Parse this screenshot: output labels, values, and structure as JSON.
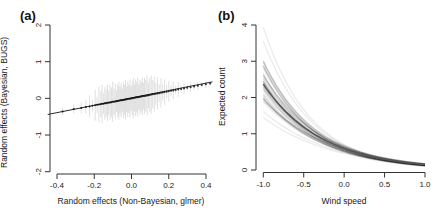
{
  "figure": {
    "background": "#ffffff",
    "text_color": "#1a1a1a",
    "axis_color": "#333333"
  },
  "chart_data": [
    {
      "id": "a",
      "panel_label": "(a)",
      "type": "scatter",
      "xlabel": "Random effects (Non-Bayesian, glmer)",
      "ylabel": "Random effects (Bayesian, BUGS)",
      "xlim": [
        -0.45,
        0.49
      ],
      "ylim": [
        -2,
        2
      ],
      "xticks": {
        "values": [
          -0.4,
          -0.2,
          0,
          0.2,
          0.4
        ],
        "labels": [
          "-0.4",
          "-0.2",
          "0.0",
          "0.2",
          "0.4"
        ]
      },
      "yticks": {
        "values": [
          -2,
          -1,
          0,
          1,
          2
        ],
        "labels": [
          "-2",
          "-1",
          "0",
          "1",
          "2"
        ]
      },
      "grid": false,
      "identity_line": {
        "x1": -0.45,
        "y1": -0.44,
        "x2": 0.435,
        "y2": 0.45
      },
      "colors": {
        "points": "rgba(15,15,15,0.85)",
        "ci": "rgba(0,0,0,0.13)",
        "line": "#2b2b2b",
        "axis": "#333333"
      },
      "point_format": [
        "x",
        "y",
        "ci_half_width"
      ],
      "points": [
        [
          -0.37,
          -0.36,
          0.1
        ],
        [
          -0.31,
          -0.29,
          0.12
        ],
        [
          -0.27,
          -0.26,
          0.15
        ],
        [
          -0.245,
          -0.235,
          0.18
        ],
        [
          -0.225,
          -0.22,
          0.3
        ],
        [
          -0.21,
          -0.2,
          0.16
        ],
        [
          -0.195,
          -0.19,
          0.42
        ],
        [
          -0.185,
          -0.175,
          0.22
        ],
        [
          -0.175,
          -0.165,
          0.48
        ],
        [
          -0.165,
          -0.16,
          0.35
        ],
        [
          -0.158,
          -0.15,
          0.52
        ],
        [
          -0.15,
          -0.145,
          0.28
        ],
        [
          -0.143,
          -0.135,
          0.45
        ],
        [
          -0.136,
          -0.132,
          0.38
        ],
        [
          -0.129,
          -0.122,
          0.5
        ],
        [
          -0.122,
          -0.118,
          0.33
        ],
        [
          -0.115,
          -0.11,
          0.47
        ],
        [
          -0.108,
          -0.105,
          0.4
        ],
        [
          -0.101,
          -0.096,
          0.55
        ],
        [
          -0.094,
          -0.091,
          0.36
        ],
        [
          -0.087,
          -0.083,
          0.49
        ],
        [
          -0.08,
          -0.078,
          0.3
        ],
        [
          -0.074,
          -0.07,
          0.44
        ],
        [
          -0.068,
          -0.066,
          0.52
        ],
        [
          -0.062,
          -0.059,
          0.37
        ],
        [
          -0.056,
          -0.054,
          0.46
        ],
        [
          -0.05,
          -0.049,
          0.31
        ],
        [
          -0.044,
          -0.042,
          0.5
        ],
        [
          -0.038,
          -0.037,
          0.41
        ],
        [
          -0.032,
          -0.03,
          0.54
        ],
        [
          -0.026,
          -0.026,
          0.35
        ],
        [
          -0.02,
          -0.019,
          0.48
        ],
        [
          -0.014,
          -0.013,
          0.39
        ],
        [
          -0.008,
          -0.008,
          0.52
        ],
        [
          -0.002,
          -0.002,
          0.33
        ],
        [
          0.004,
          0.004,
          0.46
        ],
        [
          0.01,
          0.01,
          0.55
        ],
        [
          0.016,
          0.015,
          0.37
        ],
        [
          0.022,
          0.021,
          0.5
        ],
        [
          0.028,
          0.027,
          0.42
        ],
        [
          0.034,
          0.033,
          0.53
        ],
        [
          0.04,
          0.038,
          0.34
        ],
        [
          0.046,
          0.044,
          0.47
        ],
        [
          0.052,
          0.05,
          0.4
        ],
        [
          0.058,
          0.056,
          0.51
        ],
        [
          0.064,
          0.062,
          0.36
        ],
        [
          0.07,
          0.067,
          0.49
        ],
        [
          0.077,
          0.074,
          0.43
        ],
        [
          0.084,
          0.081,
          0.54
        ],
        [
          0.091,
          0.087,
          0.35
        ],
        [
          0.098,
          0.094,
          0.46
        ],
        [
          0.106,
          0.102,
          0.52
        ],
        [
          0.114,
          0.11,
          0.38
        ],
        [
          0.122,
          0.117,
          0.48
        ],
        [
          0.13,
          0.125,
          0.3
        ],
        [
          0.139,
          0.134,
          0.44
        ],
        [
          0.148,
          0.142,
          0.25
        ],
        [
          0.158,
          0.152,
          0.4
        ],
        [
          0.168,
          0.161,
          0.22
        ],
        [
          0.178,
          0.171,
          0.35
        ],
        [
          0.189,
          0.182,
          0.18
        ],
        [
          0.2,
          0.192,
          0.28
        ],
        [
          0.212,
          0.204,
          0.15
        ],
        [
          0.224,
          0.215,
          0.24
        ],
        [
          0.237,
          0.228,
          0.12
        ],
        [
          0.251,
          0.241,
          0.2
        ],
        [
          0.266,
          0.255,
          0.1
        ],
        [
          0.282,
          0.271,
          0.16
        ],
        [
          0.299,
          0.287,
          0.09
        ],
        [
          0.317,
          0.304,
          0.13
        ],
        [
          0.336,
          0.323,
          0.08
        ],
        [
          0.356,
          0.342,
          0.11
        ],
        [
          0.377,
          0.362,
          0.07
        ],
        [
          0.399,
          0.383,
          0.1
        ],
        [
          0.422,
          0.405,
          0.06
        ]
      ]
    },
    {
      "id": "b",
      "panel_label": "(b)",
      "type": "line",
      "xlabel": "Wind speed",
      "ylabel": "Expected count",
      "xlim": [
        -1,
        1
      ],
      "ylim": [
        0,
        4
      ],
      "xticks": {
        "values": [
          -1,
          -0.5,
          0,
          0.5,
          1
        ],
        "labels": [
          "-1.0",
          "-0.5",
          "0.0",
          "0.5",
          "1.0"
        ]
      },
      "yticks": {
        "values": [
          0,
          1,
          2,
          3,
          4
        ],
        "labels": [
          "0",
          "1",
          "2",
          "3",
          "4"
        ]
      },
      "grid": false,
      "model": "y = exp(a + b * x)",
      "mean_curve": {
        "a": -0.52,
        "b": -1.38
      },
      "mean_values_readoff": {
        "x": [
          -1,
          0,
          1
        ],
        "y": [
          2.4,
          0.6,
          0.15
        ]
      },
      "colors": {
        "draws": "rgba(0,0,0,0.08)",
        "mean": "#555555",
        "axis": "#333333"
      },
      "posterior_draws_ab": [
        [
          -0.45,
          -1.55
        ],
        [
          -0.62,
          -1.3
        ],
        [
          -0.5,
          -1.25
        ],
        [
          -0.7,
          -1.6
        ],
        [
          -0.4,
          -1.35
        ],
        [
          -0.58,
          -1.5
        ],
        [
          -0.65,
          -1.28
        ],
        [
          -0.48,
          -1.45
        ],
        [
          -0.55,
          -1.2
        ],
        [
          -0.6,
          -1.58
        ],
        [
          -0.42,
          -1.48
        ],
        [
          -0.68,
          -1.38
        ],
        [
          -0.52,
          -1.62
        ],
        [
          -0.46,
          -1.3
        ],
        [
          -0.63,
          -1.52
        ],
        [
          -0.57,
          -1.25
        ],
        [
          -0.44,
          -1.4
        ],
        [
          -0.66,
          -1.47
        ],
        [
          -0.51,
          -1.33
        ],
        [
          -0.59,
          -1.55
        ],
        [
          -0.47,
          -1.27
        ],
        [
          -0.64,
          -1.43
        ],
        [
          -0.53,
          -1.58
        ],
        [
          -0.43,
          -1.32
        ],
        [
          -0.61,
          -1.49
        ],
        [
          -0.56,
          -1.22
        ],
        [
          -0.49,
          -1.52
        ],
        [
          -0.67,
          -1.35
        ],
        [
          -0.54,
          -1.6
        ],
        [
          -0.45,
          -1.38
        ],
        [
          -0.62,
          -1.45
        ],
        [
          -0.5,
          -1.55
        ],
        [
          -0.58,
          -1.3
        ],
        [
          -0.41,
          -1.5
        ],
        [
          -0.69,
          -1.42
        ],
        [
          -0.52,
          -1.36
        ],
        [
          -0.6,
          -1.48
        ],
        [
          -0.48,
          -1.58
        ],
        [
          -0.55,
          -1.44
        ],
        [
          -0.65,
          -1.33
        ],
        [
          -0.35,
          -1.72
        ],
        [
          -0.78,
          -1.15
        ],
        [
          -0.38,
          -1.65
        ],
        [
          -0.72,
          -1.2
        ]
      ]
    }
  ]
}
